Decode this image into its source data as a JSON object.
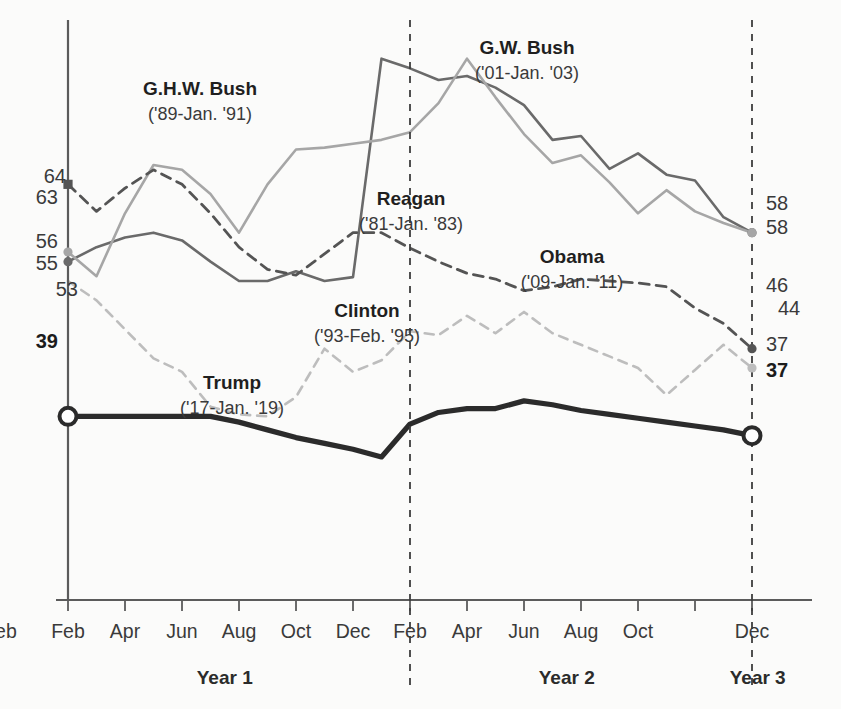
{
  "chart_data": {
    "type": "line",
    "title": "",
    "subtitle": "",
    "xlabel": "",
    "ylabel": "",
    "grid": false,
    "legend_position": "inline-annotations",
    "ylim": [
      20,
      80
    ],
    "xlim": [
      0,
      25
    ],
    "x_tick_labels": [
      "Feb",
      "Apr",
      "Jun",
      "Aug",
      "Oct",
      "Dec",
      "Feb",
      "Apr",
      "Jun",
      "Aug",
      "Oct",
      "Dec",
      "Feb"
    ],
    "x_tick_positions": [
      0,
      2,
      4,
      6,
      8,
      10,
      12,
      14,
      16,
      18,
      20,
      24
    ],
    "year_bands": [
      {
        "label": "Year 1",
        "center_month": 5.5
      },
      {
        "label": "Year 2",
        "center_month": 17.5
      },
      {
        "label": "Year 3",
        "center_month": 24.2
      }
    ],
    "dividers_at_months": [
      12,
      24
    ],
    "start_labels": [
      {
        "text": "64",
        "value": 64,
        "series": "G.W. Bush",
        "bold": false
      },
      {
        "text": "63",
        "value": 63,
        "series": "Reagan-dashed",
        "bold": false
      },
      {
        "text": "56",
        "value": 56,
        "series": "Reagan",
        "bold": false
      },
      {
        "text": "55",
        "value": 55,
        "series": "G.H.W. Bush",
        "bold": false
      },
      {
        "text": "53",
        "value": 53,
        "series": "Clinton",
        "bold": false
      },
      {
        "text": "39",
        "value": 39,
        "series": "Trump",
        "bold": true
      }
    ],
    "end_labels": [
      {
        "text": "58",
        "value": 58,
        "series": "Reagan",
        "bold": false
      },
      {
        "text": "58",
        "value": 58,
        "series": "G.H.W. Bush",
        "bold": false
      },
      {
        "text": "46",
        "value": 46,
        "series": "G.W. Bush",
        "bold": false
      },
      {
        "text": "44",
        "value": 44,
        "series": "Clinton",
        "bold": false
      },
      {
        "text": "37",
        "value": 37,
        "series": "Trump-plain",
        "bold": false
      },
      {
        "text": "37",
        "value": 37,
        "series": "Trump",
        "bold": true
      }
    ],
    "annotations": [
      {
        "name": "G.H.W. Bush",
        "period": "('89-Jan. '91)",
        "x": 200,
        "y": 95
      },
      {
        "name": "G.W. Bush",
        "period": "('01-Jan. '03)",
        "x": 527,
        "y": 54
      },
      {
        "name": "Reagan",
        "period": "('81-Jan. '83)",
        "x": 411,
        "y": 205
      },
      {
        "name": "Obama",
        "period": "('09-Jan. '11)",
        "x": 572,
        "y": 263
      },
      {
        "name": "Clinton",
        "period": "('93-Feb. '95)",
        "x": 367,
        "y": 317
      },
      {
        "name": "Trump",
        "period": "('17-Jan. '19)",
        "x": 232,
        "y": 389
      }
    ],
    "series": [
      {
        "name": "Trump",
        "label": "Trump",
        "period": "('17-Jan. '19)",
        "color": "#2b2b2b",
        "width": 5.2,
        "dash": "none",
        "start_marker": "open-circle",
        "end_marker": "open-circle",
        "values": [
          39,
          39,
          39,
          39,
          39,
          39,
          38.4,
          37.6,
          36.8,
          36.2,
          35.6,
          34.8,
          38.2,
          39.4,
          39.8,
          39.8,
          40.6,
          40.2,
          39.6,
          39.2,
          38.8,
          38.4,
          38.0,
          37.6,
          37.0
        ]
      },
      {
        "name": "G.H.W. Bush",
        "label": "G.H.W. Bush",
        "period": "('89-Jan. '91)",
        "color": "#6a6a6a",
        "width": 2.6,
        "dash": "none",
        "start_marker": "dot",
        "end_marker": "dot",
        "values": [
          55,
          56.5,
          57.5,
          58,
          57.2,
          55,
          53,
          53,
          54,
          53,
          53.4,
          76,
          75,
          73.8,
          74.2,
          73,
          71.2,
          67.6,
          68,
          64.6,
          66.2,
          64,
          63.4,
          59.6,
          58
        ]
      },
      {
        "name": "Reagan",
        "label": "Reagan",
        "period": "('81-Jan. '83)",
        "color": "#a6a6a6",
        "width": 2.6,
        "dash": "none",
        "start_marker": "dot",
        "end_marker": "dot",
        "values": [
          56,
          53.5,
          60,
          65,
          64.5,
          62,
          58,
          63,
          66.6,
          66.8,
          67.2,
          67.6,
          68.4,
          71.4,
          76,
          72,
          68.2,
          65.2,
          66,
          63.2,
          60,
          62.4,
          60.2,
          59,
          58
        ]
      },
      {
        "name": "G.W. Bush",
        "label": "G.W. Bush",
        "period": "('01-Jan. '03)",
        "color": "#545454",
        "width": 2.8,
        "dash": "10 7",
        "start_marker": "square",
        "end_marker": "dot",
        "values": [
          63,
          60.2,
          62.6,
          64.5,
          63,
          60,
          56.5,
          54.2,
          53.6,
          55.8,
          58,
          58,
          56.4,
          55,
          53.8,
          53.2,
          52,
          52.4,
          53.2,
          53,
          52.8,
          52.4,
          50.2,
          48.6,
          46
        ]
      },
      {
        "name": "Clinton",
        "label": "Clinton",
        "period": "('93-Feb. '95)",
        "color": "#bdbdbd",
        "width": 2.6,
        "dash": "9 7",
        "start_marker": "none",
        "end_marker": "dot",
        "values": [
          53,
          51,
          48,
          45,
          43.6,
          40,
          39.2,
          39,
          41,
          46,
          43.6,
          44.8,
          47.8,
          47.4,
          49.4,
          47.6,
          49.8,
          47.6,
          46.4,
          45.2,
          44,
          41.2,
          43.8,
          46.4,
          44
        ]
      }
    ]
  }
}
